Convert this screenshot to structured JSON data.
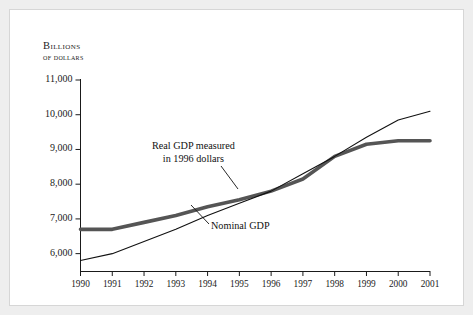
{
  "figure": {
    "background_color": "#ffffff",
    "frame_color": "#ededed",
    "axis_color": "#1a1a1a"
  },
  "axis_title": {
    "line1": "Billions",
    "line2": "of dollars"
  },
  "annotations": {
    "real": {
      "line1": "Real GDP measured",
      "line2": "in 1996 dollars"
    },
    "nominal": {
      "line1": "Nominal GDP"
    }
  },
  "chart_data": {
    "type": "line",
    "title": "",
    "xlabel": "",
    "ylabel": "Billions of dollars",
    "categories": [
      "1990",
      "1991",
      "1992",
      "1993",
      "1994",
      "1995",
      "1996",
      "1997",
      "1998",
      "1999",
      "2000",
      "2001"
    ],
    "x": [
      1990,
      1991,
      1992,
      1993,
      1994,
      1995,
      1996,
      1997,
      1998,
      1999,
      2000,
      2001
    ],
    "xlim": [
      1990,
      2001
    ],
    "ylim": [
      5500,
      11000
    ],
    "ytick_labels": [
      "11,000",
      "10,000",
      "9,000",
      "8,000",
      "7,000",
      "6,000"
    ],
    "ytick_values": [
      11000,
      10000,
      9000,
      8000,
      7000,
      6000
    ],
    "grid": false,
    "legend_position": "inline-annotations",
    "series": [
      {
        "name": "Real GDP measured in 1996 dollars",
        "style": "thick-gray",
        "color": "#555555",
        "line_width": 3.6,
        "values": [
          6700,
          6700,
          6900,
          7100,
          7350,
          7550,
          7800,
          8150,
          8800,
          9150,
          9250,
          9250
        ]
      },
      {
        "name": "Nominal GDP",
        "style": "thin-black",
        "color": "#111111",
        "line_width": 1.1,
        "values": [
          5800,
          6000,
          6350,
          6700,
          7100,
          7450,
          7800,
          8300,
          8800,
          9350,
          9850,
          10100
        ]
      }
    ]
  }
}
